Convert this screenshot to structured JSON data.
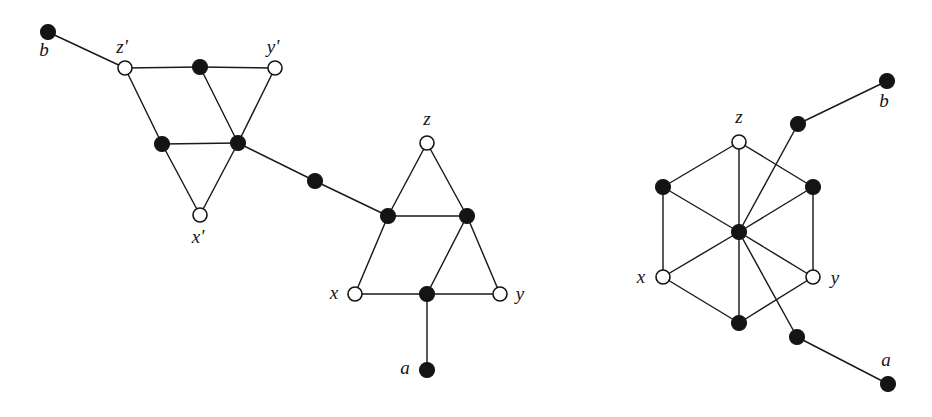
{
  "figure": {
    "background_color": "#ffffff",
    "ink_color": "#141414",
    "width": 932,
    "height": 417
  },
  "legend": {
    "filled_node_meaning": "filled vertex",
    "open_node_meaning": "open (hollow) vertex"
  },
  "graphs": [
    {
      "id": "left-graph",
      "name": "left-construction",
      "nodes": [
        {
          "id": "L-b",
          "label": "b",
          "label_dx": -4,
          "label_dy": 20,
          "x": 48,
          "y": 32,
          "style": "filled"
        },
        {
          "id": "L-zprime",
          "label": "z'",
          "label_dx": -3,
          "label_dy": -19,
          "x": 125,
          "y": 68,
          "style": "open"
        },
        {
          "id": "L-top-mid",
          "label": "",
          "label_dx": 0,
          "label_dy": 0,
          "x": 200,
          "y": 67,
          "style": "filled"
        },
        {
          "id": "L-yprime",
          "label": "y'",
          "label_dx": -2,
          "label_dy": -19,
          "x": 275,
          "y": 68,
          "style": "open"
        },
        {
          "id": "L-mid-left",
          "label": "",
          "label_dx": 0,
          "label_dy": 0,
          "x": 162,
          "y": 144,
          "style": "filled"
        },
        {
          "id": "L-center",
          "label": "",
          "label_dx": 0,
          "label_dy": 0,
          "x": 238,
          "y": 143,
          "style": "filled"
        },
        {
          "id": "L-xprime",
          "label": "x'",
          "label_dx": -2,
          "label_dy": 24,
          "x": 200,
          "y": 215,
          "style": "open"
        }
      ],
      "edges": [
        [
          "L-b",
          "L-zprime"
        ],
        [
          "L-zprime",
          "L-top-mid"
        ],
        [
          "L-top-mid",
          "L-yprime"
        ],
        [
          "L-zprime",
          "L-mid-left"
        ],
        [
          "L-top-mid",
          "L-center"
        ],
        [
          "L-yprime",
          "L-center"
        ],
        [
          "L-mid-left",
          "L-center"
        ],
        [
          "L-mid-left",
          "L-xprime"
        ],
        [
          "L-center",
          "L-xprime"
        ]
      ]
    },
    {
      "id": "middle-graph",
      "name": "middle-construction",
      "nodes": [
        {
          "id": "M-link",
          "label": "",
          "label_dx": 0,
          "label_dy": 0,
          "x": 315,
          "y": 181,
          "style": "filled"
        },
        {
          "id": "M-z",
          "label": "z",
          "label_dx": 0,
          "label_dy": -22,
          "x": 427,
          "y": 143,
          "style": "open"
        },
        {
          "id": "M-mid-left",
          "label": "",
          "label_dx": 0,
          "label_dy": 0,
          "x": 388,
          "y": 216,
          "style": "filled"
        },
        {
          "id": "M-mid-right",
          "label": "",
          "label_dx": 0,
          "label_dy": 0,
          "x": 467,
          "y": 216,
          "style": "filled"
        },
        {
          "id": "M-x",
          "label": "x",
          "label_dx": -21,
          "label_dy": 1,
          "x": 355,
          "y": 294,
          "style": "open"
        },
        {
          "id": "M-bot-mid",
          "label": "",
          "label_dx": 0,
          "label_dy": 0,
          "x": 427,
          "y": 294,
          "style": "filled"
        },
        {
          "id": "M-y",
          "label": "y",
          "label_dx": 20,
          "label_dy": 2,
          "x": 500,
          "y": 294,
          "style": "open"
        },
        {
          "id": "M-a",
          "label": "a",
          "label_dx": -22,
          "label_dy": 0,
          "x": 427,
          "y": 370,
          "style": "filled"
        }
      ],
      "edges": [
        [
          "M-link",
          "M-mid-left"
        ],
        [
          "M-z",
          "M-mid-left"
        ],
        [
          "M-z",
          "M-mid-right"
        ],
        [
          "M-mid-left",
          "M-mid-right"
        ],
        [
          "M-mid-left",
          "M-x"
        ],
        [
          "M-mid-right",
          "M-bot-mid"
        ],
        [
          "M-mid-right",
          "M-y"
        ],
        [
          "M-x",
          "M-bot-mid"
        ],
        [
          "M-bot-mid",
          "M-y"
        ],
        [
          "M-bot-mid",
          "M-a"
        ]
      ],
      "external_edges": [
        [
          "L-center",
          "M-link"
        ]
      ]
    },
    {
      "id": "right-graph",
      "name": "right-construction",
      "nodes": [
        {
          "id": "R-b",
          "label": "b",
          "label_dx": -3,
          "label_dy": 22,
          "x": 887,
          "y": 81,
          "style": "filled"
        },
        {
          "id": "R-b-link",
          "label": "",
          "label_dx": 0,
          "label_dy": 0,
          "x": 798,
          "y": 124,
          "style": "filled"
        },
        {
          "id": "R-z",
          "label": "z",
          "label_dx": 0,
          "label_dy": -23,
          "x": 739,
          "y": 142,
          "style": "open"
        },
        {
          "id": "R-upleft",
          "label": "",
          "label_dx": 0,
          "label_dy": 0,
          "x": 663,
          "y": 187,
          "style": "filled"
        },
        {
          "id": "R-upright",
          "label": "",
          "label_dx": 0,
          "label_dy": 0,
          "x": 813,
          "y": 187,
          "style": "filled"
        },
        {
          "id": "R-center",
          "label": "",
          "label_dx": 0,
          "label_dy": 0,
          "x": 739,
          "y": 232,
          "style": "filled"
        },
        {
          "id": "R-x",
          "label": "x",
          "label_dx": -22,
          "label_dy": 2,
          "x": 663,
          "y": 277,
          "style": "open"
        },
        {
          "id": "R-y",
          "label": "y",
          "label_dx": 22,
          "label_dy": 3,
          "x": 813,
          "y": 277,
          "style": "open"
        },
        {
          "id": "R-bottom",
          "label": "",
          "label_dx": 0,
          "label_dy": 0,
          "x": 739,
          "y": 323,
          "style": "filled"
        },
        {
          "id": "R-a-link",
          "label": "",
          "label_dx": 0,
          "label_dy": 0,
          "x": 797,
          "y": 337,
          "style": "filled"
        },
        {
          "id": "R-a",
          "label": "a",
          "label_dx": -2,
          "label_dy": -22,
          "x": 888,
          "y": 384,
          "style": "filled"
        }
      ],
      "edges": [
        [
          "R-b",
          "R-b-link"
        ],
        [
          "R-b-link",
          "R-center"
        ],
        [
          "R-z",
          "R-upleft"
        ],
        [
          "R-z",
          "R-upright"
        ],
        [
          "R-z",
          "R-center"
        ],
        [
          "R-upleft",
          "R-center"
        ],
        [
          "R-upleft",
          "R-x"
        ],
        [
          "R-upright",
          "R-center"
        ],
        [
          "R-upright",
          "R-y"
        ],
        [
          "R-x",
          "R-center"
        ],
        [
          "R-x",
          "R-bottom"
        ],
        [
          "R-y",
          "R-center"
        ],
        [
          "R-y",
          "R-bottom"
        ],
        [
          "R-center",
          "R-bottom"
        ],
        [
          "R-center",
          "R-a-link"
        ],
        [
          "R-a-link",
          "R-a"
        ]
      ]
    }
  ],
  "node_radius": {
    "filled": 7.5,
    "open": 7.0
  }
}
